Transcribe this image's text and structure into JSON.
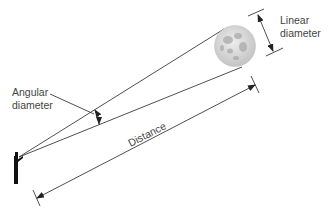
{
  "labels": {
    "linear_diameter": [
      "Linear",
      "diameter"
    ],
    "angular_diameter": [
      "Angular",
      "diameter"
    ],
    "distance": "Distance"
  },
  "colors": {
    "line": "#222222",
    "moon_base": "#d8d8d8",
    "moon_dark": "#a8a8a8",
    "text": "#444444"
  },
  "objects": {
    "observer": "person-silhouette",
    "target": "moon"
  }
}
